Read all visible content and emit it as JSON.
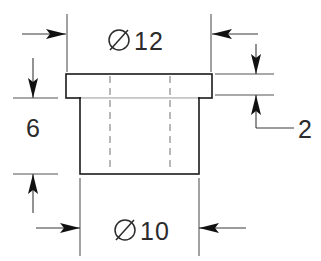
{
  "drawing": {
    "title": "Flanged bushing section view",
    "background_color": "#ffffff",
    "line_color": "#1a1a1a",
    "hidden_line_color": "#8a8a8a",
    "dimension_color": "#2b2b2b",
    "width": 321,
    "height": 261
  },
  "dimensions": {
    "flange_diameter": {
      "label": "12",
      "symbol": "Ø",
      "full_text": "Ø 12",
      "placement": "top",
      "description": "flange outer diameter"
    },
    "hub_diameter": {
      "label": "10",
      "symbol": "Ø",
      "full_text": "Ø 10",
      "placement": "bottom",
      "description": "hub outer diameter"
    },
    "hub_length": {
      "label": "6",
      "symbol": "",
      "full_text": "6",
      "placement": "left",
      "description": "hub length"
    },
    "flange_thickness": {
      "label": "2",
      "symbol": "",
      "full_text": "2",
      "placement": "right",
      "description": "flange thickness"
    }
  },
  "geometry": {
    "flange": {
      "x1": 66,
      "y1": 74,
      "x2": 212,
      "y2": 98
    },
    "hub": {
      "x1": 80,
      "y1": 98,
      "x2": 199,
      "y2": 174
    },
    "hidden_lines": [
      {
        "x": 110
      },
      {
        "x": 170
      }
    ]
  }
}
